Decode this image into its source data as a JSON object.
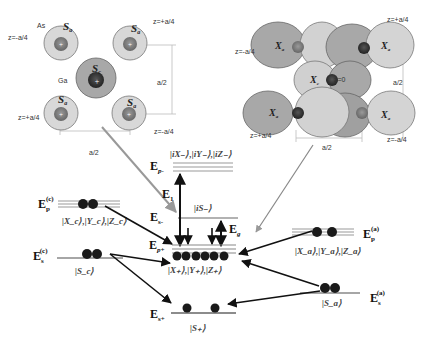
{
  "left_structure": {
    "atoms": [
      {
        "species": "As",
        "orbital": "S_a",
        "z": "z=-a/4",
        "pos": "top-left"
      },
      {
        "species": "As",
        "orbital": "S_a",
        "z": "z=+a/4",
        "pos": "top-right"
      },
      {
        "species": "Ga",
        "orbital": "S_c",
        "z": "",
        "pos": "center"
      },
      {
        "species": "As",
        "orbital": "S_a",
        "z": "z=+a/4",
        "pos": "bottom-left"
      },
      {
        "species": "As",
        "orbital": "S_a",
        "z": "z=-a/4",
        "pos": "bottom-right"
      }
    ],
    "label_as": "As",
    "label_ga": "Ga",
    "orbital_a": "S",
    "orbital_a_sub": "a",
    "orbital_c": "S",
    "orbital_c_sub": "c",
    "z_tl": "z=-a/4",
    "z_tr": "z=+a/4",
    "z_bl": "z=+a/4",
    "z_br": "z=-a/4",
    "dim_vertical": "a/2",
    "dim_horizontal": "a/2"
  },
  "right_structure": {
    "orbital_a": "X",
    "orbital_a_sub": "a",
    "orbital_c": "X",
    "orbital_c_sub": "c",
    "z_tl": "z=-a/4",
    "z_tr": "z=+a/4",
    "z_center": "z=0",
    "z_bl": "z=+a/4",
    "z_br": "z=-a/4",
    "dim_vertical": "a/2",
    "dim_horizontal": "a/2"
  },
  "energy_levels": {
    "Ep_minus": {
      "label": "E",
      "sub": "p-",
      "states": "|iX₋⟩,|iY₋⟩,|iZ₋⟩"
    },
    "Es_minus": {
      "label": "E",
      "sub": "s-",
      "states": "|iS₋⟩"
    },
    "E1": {
      "label": "E",
      "sub": "1"
    },
    "Eg": {
      "label": "E",
      "sub": "g"
    },
    "Ep_plus": {
      "label": "E",
      "sub": "p+",
      "states": "|X₊⟩,|Y₊⟩,|Z₊⟩"
    },
    "Es_plus": {
      "label": "E",
      "sub": "s+",
      "states": "|S₊⟩"
    },
    "Ep_c": {
      "label": "E",
      "sub": "p",
      "sup": "(c)",
      "states": "|X_c⟩,|Y_c⟩,|Z_c⟩"
    },
    "Es_c": {
      "label": "E",
      "sub": "s",
      "sup": "(c)",
      "states": "|S_c⟩"
    },
    "Ep_a": {
      "label": "E",
      "sub": "p",
      "sup": "(a)",
      "states": "|X_a⟩,|Y_a⟩,|Z_a⟩"
    },
    "Es_a": {
      "label": "E",
      "sub": "s",
      "sup": "(a)",
      "states": "|S_a⟩"
    }
  },
  "colors": {
    "outer_shell_light": "#d6d6d6",
    "outer_shell_mid": "#a9a9a9",
    "nucleus": "#7c7c7c",
    "nucleus_dark": "#3a3a3a",
    "level_line": "#8f8f8f",
    "electron": "#1a1a1a",
    "arrow": "#111111",
    "gray_arrow": "#9a9a9a"
  }
}
